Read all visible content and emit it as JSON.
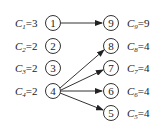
{
  "diagram": {
    "type": "bipartite-graph",
    "left_nodes": [
      {
        "id": "1",
        "label_var": "C",
        "label_sub": "1",
        "label_val": "=3"
      },
      {
        "id": "2",
        "label_var": "C",
        "label_sub": "2",
        "label_val": "=2"
      },
      {
        "id": "3",
        "label_var": "C",
        "label_sub": "3",
        "label_val": "=2"
      },
      {
        "id": "4",
        "label_var": "C",
        "label_sub": "4",
        "label_val": "=2"
      }
    ],
    "right_nodes": [
      {
        "id": "9",
        "label_var": "C",
        "label_sub": "9",
        "label_val": "=9"
      },
      {
        "id": "8",
        "label_var": "C",
        "label_sub": "8",
        "label_val": "=4"
      },
      {
        "id": "7",
        "label_var": "C",
        "label_sub": "7",
        "label_val": "=4"
      },
      {
        "id": "6",
        "label_var": "C",
        "label_sub": "6",
        "label_val": "=4"
      },
      {
        "id": "5",
        "label_var": "C",
        "label_sub": "5",
        "label_val": "=4"
      }
    ],
    "edges": [
      {
        "from": "1",
        "to": "9"
      },
      {
        "from": "4",
        "to": "8"
      },
      {
        "from": "4",
        "to": "7"
      },
      {
        "from": "4",
        "to": "6"
      },
      {
        "from": "4",
        "to": "5"
      }
    ]
  }
}
